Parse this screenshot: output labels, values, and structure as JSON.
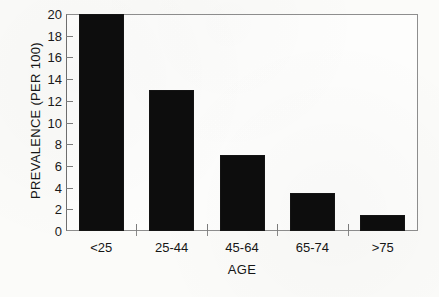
{
  "chart_data": {
    "type": "bar",
    "title": "",
    "xlabel": "AGE",
    "ylabel": "PREVALENCE (PER 100)",
    "categories": [
      "<25",
      "25-44",
      "45-64",
      "65-74",
      ">75"
    ],
    "values": [
      20,
      13,
      7,
      3.5,
      1.5
    ],
    "ylim": [
      0,
      20
    ],
    "yticks": [
      0,
      2,
      4,
      6,
      8,
      10,
      12,
      14,
      16,
      18,
      20
    ],
    "ytick_labels": [
      "0",
      "2",
      "4",
      "6",
      "8",
      "10",
      "12",
      "14",
      "16",
      "18",
      "20"
    ],
    "grid": false,
    "legend": false,
    "bar_color": "#0d0d0d",
    "axis_color": "#8e8e8e",
    "background": "#fbfbf9"
  }
}
